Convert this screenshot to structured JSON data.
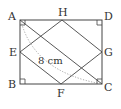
{
  "diagram": {
    "points": {
      "A": {
        "label": "A",
        "x": 20,
        "y": 20
      },
      "D": {
        "label": "D",
        "x": 102,
        "y": 20
      },
      "B": {
        "label": "B",
        "x": 20,
        "y": 84
      },
      "C": {
        "label": "C",
        "x": 102,
        "y": 84
      },
      "H": {
        "label": "H",
        "x": 62,
        "y": 20
      },
      "E": {
        "label": "E",
        "x": 20,
        "y": 52
      },
      "G": {
        "label": "G",
        "x": 102,
        "y": 52
      },
      "F": {
        "label": "F",
        "x": 61,
        "y": 84
      }
    },
    "length_label": "8 cm",
    "colors": {
      "line": "#444444",
      "dotted": "#9a9a9a"
    }
  }
}
